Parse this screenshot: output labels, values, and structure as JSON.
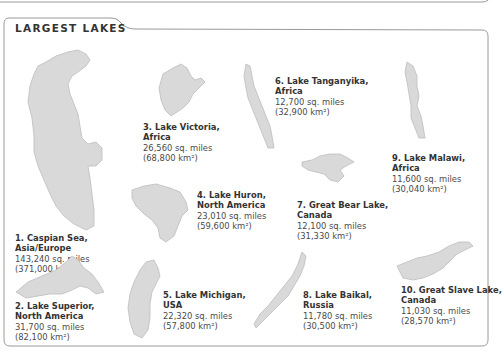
{
  "header": {
    "title": "LARGEST LAKES"
  },
  "colors": {
    "lake_fill": "#d9d9d9",
    "lake_stroke": "#bdbdbd",
    "border": "#9a9a9a",
    "text": "#333333"
  },
  "lakes": [
    {
      "rank": 1,
      "name_line1": "1. Caspian Sea,",
      "name_line2": "Asia/Europe",
      "sq_miles": "143,240 sq. miles",
      "sq_km": "(371,000 km²)"
    },
    {
      "rank": 2,
      "name_line1": "2. Lake Superior,",
      "name_line2": "North America",
      "sq_miles": "31,700 sq. miles",
      "sq_km": "(82,100 km²)"
    },
    {
      "rank": 3,
      "name_line1": "3. Lake Victoria,",
      "name_line2": "Africa",
      "sq_miles": "26,560 sq. miles",
      "sq_km": "(68,800 km²)"
    },
    {
      "rank": 4,
      "name_line1": "4. Lake Huron,",
      "name_line2": "North America",
      "sq_miles": "23,010 sq. miles",
      "sq_km": "(59,600 km²)"
    },
    {
      "rank": 5,
      "name_line1": "5. Lake Michigan,",
      "name_line2": "USA",
      "sq_miles": "22,320 sq. miles",
      "sq_km": "(57,800 km²)"
    },
    {
      "rank": 6,
      "name_line1": "6. Lake Tanganyika,",
      "name_line2": "Africa",
      "sq_miles": "12,700 sq. miles",
      "sq_km": "(32,900 km²)"
    },
    {
      "rank": 7,
      "name_line1": "7. Great Bear Lake,",
      "name_line2": "Canada",
      "sq_miles": "12,100 sq. miles",
      "sq_km": "(31,330 km²)"
    },
    {
      "rank": 8,
      "name_line1": "8. Lake Baikal,",
      "name_line2": "Russia",
      "sq_miles": "11,780 sq. miles",
      "sq_km": "(30,500 km²)"
    },
    {
      "rank": 9,
      "name_line1": "9. Lake Malawi,",
      "name_line2": "Africa",
      "sq_miles": "11,600 sq. miles",
      "sq_km": "(30,040 km²)"
    },
    {
      "rank": 10,
      "name_line1": "10. Great Slave Lake,",
      "name_line2": "Canada",
      "sq_miles": "11,030 sq. miles",
      "sq_km": "(28,570 km²)"
    }
  ]
}
